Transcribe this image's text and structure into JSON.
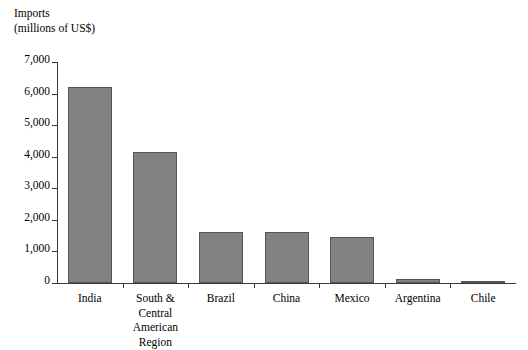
{
  "chart_data": {
    "type": "bar",
    "title": "Imports",
    "subtitle": "(millions of US$)",
    "ylabel": "Imports (millions of US$)",
    "xlabel": "",
    "grid": false,
    "legend": "none",
    "ylim": [
      0,
      7000
    ],
    "ytick_values": [
      0,
      1000,
      2000,
      3000,
      4000,
      5000,
      6000,
      7000
    ],
    "ytick_labels": [
      "0",
      "1,000",
      "2,000",
      "3,000",
      "4,000",
      "5,000",
      "6,000",
      "7,000"
    ],
    "categories": [
      "India",
      "South & Central American Region",
      "Brazil",
      "China",
      "Mexico",
      "Argentina",
      "Chile"
    ],
    "category_label_lines": [
      [
        "India"
      ],
      [
        "South &",
        "Central",
        "American",
        "Region"
      ],
      [
        "Brazil"
      ],
      [
        "China"
      ],
      [
        "Mexico"
      ],
      [
        "Argentina"
      ],
      [
        "Chile"
      ]
    ],
    "values": [
      6200,
      4150,
      1630,
      1620,
      1470,
      130,
      60
    ],
    "bar_color": "#828282",
    "bar_border_color": "#555555",
    "axis_color": "#3a3a3a",
    "background_color": "#ffffff"
  }
}
